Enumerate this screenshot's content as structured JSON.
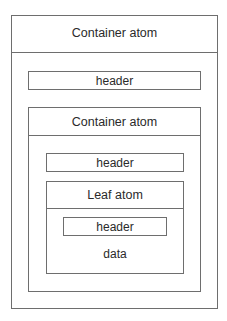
{
  "diagram": {
    "outer_container": {
      "title": "Container atom",
      "header": "header",
      "inner_container": {
        "title": "Container atom",
        "header": "header",
        "leaf": {
          "title": "Leaf atom",
          "header": "header",
          "data": "data"
        }
      }
    }
  }
}
